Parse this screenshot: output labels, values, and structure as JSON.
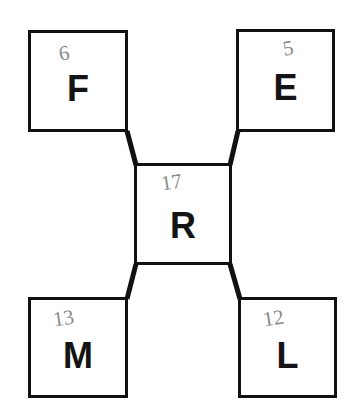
{
  "diagram": {
    "background_color": "#ffffff",
    "stroke_color": "#111111",
    "annotation_color": "#8a8a8a",
    "nodes": [
      {
        "id": "f",
        "label": "F",
        "annotation": "6",
        "position": "top-left"
      },
      {
        "id": "e",
        "label": "E",
        "annotation": "5",
        "position": "top-right"
      },
      {
        "id": "r",
        "label": "R",
        "annotation": "17",
        "position": "center"
      },
      {
        "id": "m",
        "label": "M",
        "annotation": "13",
        "position": "bottom-left"
      },
      {
        "id": "l",
        "label": "L",
        "annotation": "12",
        "position": "bottom-right"
      }
    ],
    "edges": [
      {
        "id": "edge-f-r",
        "from": "f",
        "to": "r"
      },
      {
        "id": "edge-e-r",
        "from": "e",
        "to": "r"
      },
      {
        "id": "edge-m-r",
        "from": "m",
        "to": "r"
      },
      {
        "id": "edge-l-r",
        "from": "l",
        "to": "r"
      }
    ]
  }
}
